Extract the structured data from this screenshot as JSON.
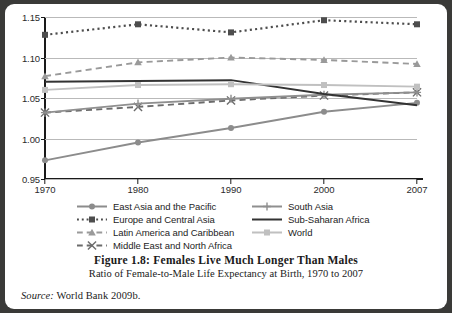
{
  "figure": {
    "caption_title": "Figure 1.8: Females Live Much Longer Than Males",
    "caption_subtitle": "Ratio of Female-to-Male Life Expectancy at Birth, 1970 to 2007",
    "source_label": "Source:",
    "source_text": "World Bank 2009b."
  },
  "legend": {
    "left_items": [
      {
        "label": "East Asia and the Pacific"
      },
      {
        "label": "Europe and Central Asia"
      },
      {
        "label": "Latin America and Caribbean"
      },
      {
        "label": "Middle East and North Africa"
      }
    ],
    "right_items": [
      {
        "label": "South Asia"
      },
      {
        "label": "Sub-Saharan Africa"
      },
      {
        "label": "World"
      }
    ]
  },
  "axis": {
    "y_ticks": [
      "1.15",
      "1.10",
      "1.05",
      "1.00",
      "0.95"
    ],
    "x_ticks": [
      "1970",
      "1980",
      "1990",
      "2000",
      "2007"
    ]
  },
  "chart_data": {
    "type": "line",
    "title": "Figure 1.8: Females Live Much Longer Than Males",
    "subtitle": "Ratio of Female-to-Male Life Expectancy at Birth, 1970 to 2007",
    "xlabel": "",
    "ylabel": "",
    "categories": [
      "1970",
      "1980",
      "1990",
      "2000",
      "2007"
    ],
    "ylim": [
      0.95,
      1.15
    ],
    "ytick_step": 0.05,
    "grid": true,
    "legend_position": "below-plot",
    "series": [
      {
        "name": "East Asia and the Pacific",
        "values": [
          0.973,
          0.995,
          1.013,
          1.033,
          1.044
        ],
        "color": "#8c8c8c",
        "line_style": "solid",
        "marker": "circle"
      },
      {
        "name": "Europe and Central Asia",
        "values": [
          1.128,
          1.141,
          1.131,
          1.146,
          1.141
        ],
        "color": "#4d4d4d",
        "line_style": "dotted",
        "marker": "square"
      },
      {
        "name": "Latin America and Caribbean",
        "values": [
          1.077,
          1.094,
          1.1,
          1.097,
          1.092
        ],
        "color": "#9a9a9a",
        "line_style": "dashed",
        "marker": "triangle"
      },
      {
        "name": "Middle East and North Africa",
        "values": [
          1.032,
          1.039,
          1.047,
          1.053,
          1.057
        ],
        "color": "#6b6b6b",
        "line_style": "dashed",
        "marker": "x"
      },
      {
        "name": "South Asia",
        "values": [
          1.032,
          1.043,
          1.049,
          1.054,
          1.057
        ],
        "color": "#8f8f8f",
        "line_style": "solid",
        "marker": "plus"
      },
      {
        "name": "Sub-Saharan Africa",
        "values": [
          1.07,
          1.071,
          1.072,
          1.055,
          1.041
        ],
        "color": "#333333",
        "line_style": "solid",
        "marker": "none"
      },
      {
        "name": "World",
        "values": [
          1.06,
          1.066,
          1.067,
          1.066,
          1.064
        ],
        "color": "#c0c0c0",
        "line_style": "solid",
        "marker": "square"
      }
    ]
  }
}
